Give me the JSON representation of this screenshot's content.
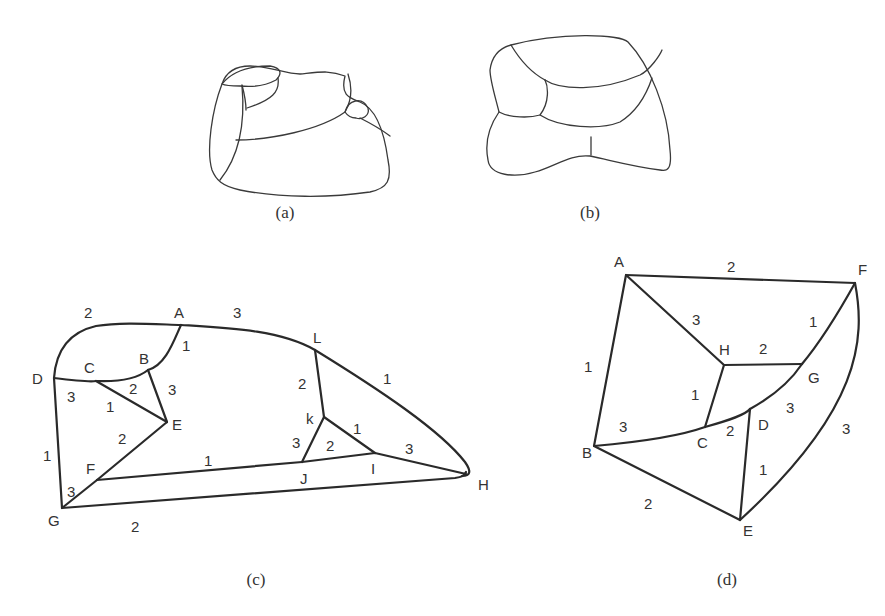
{
  "figure": {
    "panels": [
      {
        "id": "a",
        "caption": "(a)",
        "kind": "map-regions"
      },
      {
        "id": "b",
        "caption": "(b)",
        "kind": "map-regions"
      },
      {
        "id": "c",
        "caption": "(c)",
        "kind": "edge-3-colored planar graph",
        "vertices": [
          "A",
          "B",
          "C",
          "D",
          "E",
          "F",
          "G",
          "H",
          "I",
          "J",
          "k",
          "L"
        ],
        "edges": [
          {
            "from": "D",
            "to": "A",
            "label": "2"
          },
          {
            "from": "A",
            "to": "L",
            "label": "3"
          },
          {
            "from": "A",
            "to": "B",
            "label": "1"
          },
          {
            "from": "C",
            "to": "B",
            "label": "2"
          },
          {
            "from": "B",
            "to": "E",
            "label": "3"
          },
          {
            "from": "D",
            "to": "C",
            "label": "3"
          },
          {
            "from": "C",
            "to": "E",
            "label": "1"
          },
          {
            "from": "E",
            "to": "F",
            "label": "2"
          },
          {
            "from": "D",
            "to": "G",
            "label": "1"
          },
          {
            "from": "G",
            "to": "F",
            "label": "3"
          },
          {
            "from": "F",
            "to": "I",
            "label": "1"
          },
          {
            "from": "G",
            "to": "H",
            "label": "2"
          },
          {
            "from": "L",
            "to": "H",
            "label": "1"
          },
          {
            "from": "L",
            "to": "k",
            "label": "2"
          },
          {
            "from": "k",
            "to": "I",
            "label": "1"
          },
          {
            "from": "k",
            "to": "J",
            "label": "3"
          },
          {
            "from": "J",
            "to": "I",
            "label": "2"
          },
          {
            "from": "I",
            "to": "H",
            "label": "3"
          }
        ]
      },
      {
        "id": "d",
        "caption": "(d)",
        "kind": "edge-3-colored planar graph",
        "vertices": [
          "A",
          "B",
          "C",
          "D",
          "E",
          "F",
          "G",
          "H"
        ],
        "edges": [
          {
            "from": "A",
            "to": "F",
            "label": "2"
          },
          {
            "from": "A",
            "to": "H",
            "label": "3"
          },
          {
            "from": "A",
            "to": "B",
            "label": "1"
          },
          {
            "from": "H",
            "to": "G",
            "label": "2"
          },
          {
            "from": "H",
            "to": "C",
            "label": "1"
          },
          {
            "from": "G",
            "to": "F",
            "label": "1"
          },
          {
            "from": "B",
            "to": "C",
            "label": "3"
          },
          {
            "from": "C",
            "to": "D",
            "label": "2"
          },
          {
            "from": "D",
            "to": "G",
            "label": "3"
          },
          {
            "from": "D",
            "to": "E",
            "label": "1"
          },
          {
            "from": "B",
            "to": "E",
            "label": "2"
          },
          {
            "from": "F",
            "to": "E",
            "label": "3"
          }
        ]
      }
    ]
  },
  "labels": {
    "c": {
      "v": {
        "A": "A",
        "B": "B",
        "C": "C",
        "D": "D",
        "E": "E",
        "F": "F",
        "G": "G",
        "H": "H",
        "I": "I",
        "J": "J",
        "k": "k",
        "L": "L"
      },
      "e": {
        "DA": "2",
        "AL": "3",
        "AB": "1",
        "CB": "2",
        "BE": "3",
        "DC": "3",
        "CE": "1",
        "EF": "2",
        "DG": "1",
        "GF": "3",
        "FI": "1",
        "GH": "2",
        "LH": "1",
        "Lk": "2",
        "kI": "1",
        "kJ": "3",
        "JI": "2",
        "IH": "3"
      }
    },
    "d": {
      "v": {
        "A": "A",
        "B": "B",
        "C": "C",
        "D": "D",
        "E": "E",
        "F": "F",
        "G": "G",
        "H": "H"
      },
      "e": {
        "AF": "2",
        "AH": "3",
        "AB": "1",
        "HG": "2",
        "HC": "1",
        "GF": "1",
        "BC": "3",
        "CD": "2",
        "DG": "3",
        "DE": "1",
        "BE": "2",
        "FE": "3"
      }
    }
  },
  "colors": {
    "stroke": "#2a2a2a",
    "text": "#333333",
    "background": "#ffffff"
  }
}
